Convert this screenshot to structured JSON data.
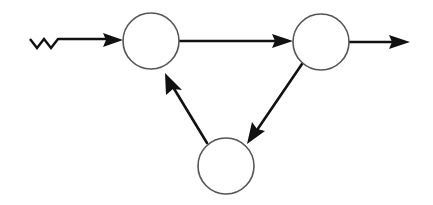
{
  "diagram": {
    "type": "directed-graph",
    "colors": {
      "background": "#ffffff",
      "node_stroke": "#555555",
      "edge": "#111111"
    },
    "nodes": [
      {
        "id": "A",
        "label": "",
        "cx": 151,
        "cy": 41,
        "r": 28
      },
      {
        "id": "B",
        "label": "",
        "cx": 321,
        "cy": 42,
        "r": 28
      },
      {
        "id": "C",
        "label": "",
        "cx": 226,
        "cy": 166,
        "r": 28
      }
    ],
    "edges": [
      {
        "from": "input",
        "to": "A",
        "style": "zigzag-then-arrow"
      },
      {
        "from": "A",
        "to": "B",
        "style": "arrow"
      },
      {
        "from": "B",
        "to": "C",
        "style": "arrow"
      },
      {
        "from": "C",
        "to": "A",
        "style": "arrow"
      },
      {
        "from": "B",
        "to": "output",
        "style": "arrow"
      }
    ]
  }
}
